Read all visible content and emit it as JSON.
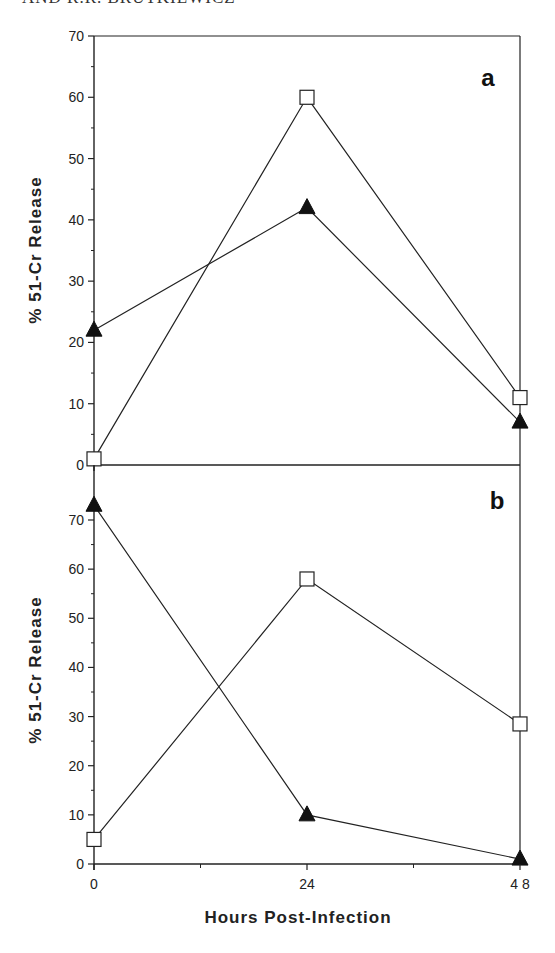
{
  "header": {
    "text": "AND R.R. BRUTKIEWICZ"
  },
  "chart_data": [
    {
      "type": "line",
      "panel": "a",
      "title": "",
      "xlabel": "Hours Post-Infection",
      "ylabel": "% 51-Cr Release",
      "x": [
        0,
        24,
        48
      ],
      "x_ticks": [
        0,
        24,
        48
      ],
      "x_minor_ticks": [
        12,
        36
      ],
      "ylim": [
        0,
        70
      ],
      "y_ticks": [
        0,
        10,
        20,
        30,
        40,
        50,
        60,
        70
      ],
      "grid": false,
      "legend": "none",
      "series": [
        {
          "name": "open-square",
          "marker": "square-open",
          "values": [
            1,
            60,
            11
          ]
        },
        {
          "name": "filled-triangle",
          "marker": "triangle-filled",
          "values": [
            22,
            42,
            7
          ]
        }
      ]
    },
    {
      "type": "line",
      "panel": "b",
      "title": "",
      "xlabel": "Hours Post-Infection",
      "ylabel": "% 51-Cr Release",
      "x": [
        0,
        24,
        48
      ],
      "x_ticks": [
        0,
        24,
        48
      ],
      "x_minor_ticks": [
        12,
        36
      ],
      "ylim": [
        0,
        70
      ],
      "y_ticks": [
        0,
        10,
        20,
        30,
        40,
        50,
        60,
        70
      ],
      "grid": false,
      "legend": "none",
      "series": [
        {
          "name": "open-square",
          "marker": "square-open",
          "values": [
            5,
            58,
            28.5
          ]
        },
        {
          "name": "filled-triangle",
          "marker": "triangle-filled",
          "values": [
            73,
            10,
            1
          ]
        }
      ]
    }
  ],
  "labels": {
    "panel_a": "a",
    "panel_b": "b",
    "ylabel": "% 51-Cr Release",
    "xlabel": "Hours Post-Infection",
    "x_tick_labels": [
      "0",
      "24",
      "4 8"
    ]
  }
}
